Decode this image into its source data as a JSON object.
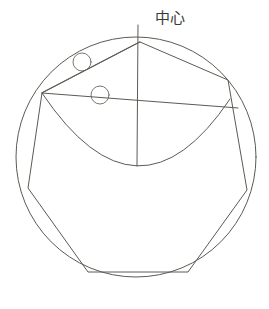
{
  "figure": {
    "title": "",
    "background_color": "#ffffff",
    "stroke_color": "#5d5a54",
    "label_color": "#3c3a36",
    "width": 269,
    "height": 309
  },
  "annotations": {
    "center_label": "中心"
  },
  "chart_data": {
    "type": "diagram",
    "title": "",
    "outer_circle": {
      "name": "outer-circle",
      "cx": 136,
      "cy": 157,
      "r": 120
    },
    "polygon": {
      "name": "inscribed-polygon",
      "vertices": [
        [
          140,
          42
        ],
        [
          228,
          80
        ],
        [
          247,
          190
        ],
        [
          188,
          272
        ],
        [
          88,
          272
        ],
        [
          28,
          188
        ],
        [
          42,
          93
        ]
      ]
    },
    "inner_arc": {
      "name": "inner-arc",
      "start": [
        42,
        93
      ],
      "end": [
        230,
        99
      ],
      "lowest_point": [
        137,
        166
      ],
      "sweep": "bowl"
    },
    "chords": [
      {
        "name": "chord-apex-left",
        "from": [
          140,
          42
        ],
        "to": [
          42,
          93
        ]
      },
      {
        "name": "chord-left-right",
        "from": [
          42,
          93
        ],
        "to": [
          238,
          108
        ]
      }
    ],
    "vertical_line": {
      "name": "vertical-center-line",
      "from": [
        138,
        25
      ],
      "to": [
        137,
        166
      ]
    },
    "small_circles": [
      {
        "name": "marker-circle-upper",
        "cx": 82,
        "cy": 62,
        "r": 9
      },
      {
        "name": "marker-circle-lower",
        "cx": 100,
        "cy": 95,
        "r": 9
      }
    ],
    "axis_ranges": {
      "x": [
        0,
        269
      ],
      "y": [
        0,
        309
      ]
    },
    "grid": false,
    "legend": null
  }
}
